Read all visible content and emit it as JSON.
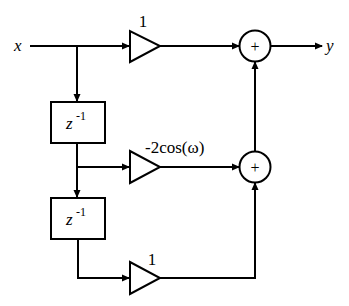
{
  "diagram": {
    "input_label": "x",
    "output_label": "y",
    "delays": [
      {
        "label_base": "z",
        "label_exp": "-1"
      },
      {
        "label_base": "z",
        "label_exp": "-1"
      }
    ],
    "gains": [
      {
        "label": "1"
      },
      {
        "label": "-2cos(ω)"
      },
      {
        "label": "1"
      }
    ],
    "adders": [
      {
        "symbol": "+"
      },
      {
        "symbol": "+"
      }
    ],
    "colors": {
      "stroke": "#000000",
      "background": "#ffffff"
    }
  }
}
